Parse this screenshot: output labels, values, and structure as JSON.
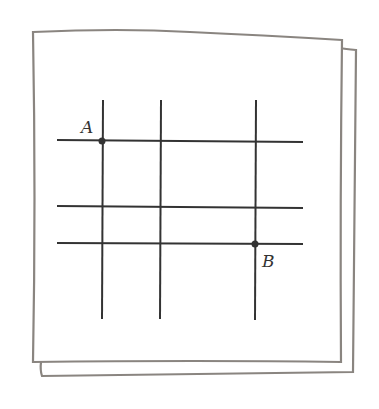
{
  "diagram": {
    "points": [
      {
        "label": "A",
        "x": 102,
        "y": 141
      },
      {
        "label": "B",
        "x": 255,
        "y": 243
      }
    ],
    "vertical_lines_x": [
      102,
      160,
      255
    ],
    "horizontal_lines_y": [
      141,
      207,
      243
    ],
    "colors": {
      "line": "#333333",
      "paper_edge": "#8a8580",
      "paper": "#ffffff"
    }
  }
}
